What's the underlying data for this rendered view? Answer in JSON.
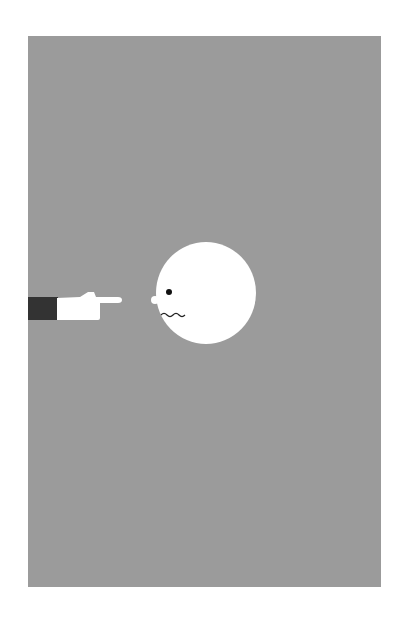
{
  "illustration": {
    "subject": "pointing hand and nervous round face",
    "colors": {
      "page_background": "#ffffff",
      "panel": "#9b9b9b",
      "sleeve": "#333333",
      "hand": "#ffffff",
      "face": "#ffffff",
      "eye": "#111111",
      "mouth": "#222222"
    }
  }
}
